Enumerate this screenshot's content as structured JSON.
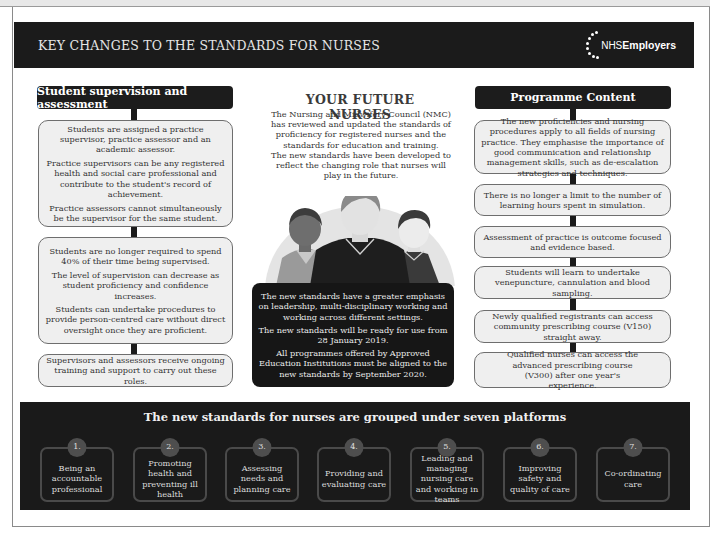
{
  "header": {
    "title": "KEY CHANGES TO THE STANDARDS FOR NURSES",
    "logo_prefix": "NHS",
    "logo_name": "Employers"
  },
  "left": {
    "title": "Student supervision and assessment",
    "boxes": [
      {
        "paragraphs": [
          "Students are assigned a practice supervisor, practice assessor and an academic assessor.",
          "Practice supervisors can be any registered health and social care professional and contribute to the student's record of achievement.",
          "Practice assessors cannot simultaneously be the supervisor for the same student."
        ]
      },
      {
        "paragraphs": [
          "Students are no longer required to spend 40% of their time being supervised.",
          "The level of supervision can decrease as student proficiency and confidence increases.",
          "Students can undertake procedures to provide person-centred care without direct oversight once they are proficient."
        ]
      },
      {
        "paragraphs": [
          "Supervisors and assessors receive ongoing training and support to carry out these roles."
        ]
      }
    ]
  },
  "center": {
    "title": "YOUR FUTURE NURSES",
    "intro": [
      "The Nursing and Midwifery Council (NMC) has reviewed and updated the standards of proficiency for registered nurses and the standards for education and training.",
      "The new standards have been developed to reflect the changing role that nurses will play in the future."
    ],
    "illustration": "three-nurses-illustration",
    "dark_box": [
      "The new standards have a greater emphasis on leadership, multi-disciplinary working and working across different settings.",
      "The new standards will be ready for use from 28 January 2019.",
      "All programmes offered by Approved Education Institutions must be aligned to the new standards by September 2020."
    ]
  },
  "right": {
    "title": "Programme Content",
    "boxes": [
      "The new proficiencies and nursing procedures apply to all fields of nursing practice. They emphasise the importance of good communication and relationship management skills, such as de-escalation strategies and techniques.",
      "There is no longer a limit to the number of learning hours spent in simulation.",
      "Assessment of practice is outcome focused and evidence based.",
      "Students will learn to undertake venepuncture, cannulation and blood sampling.",
      "Newly qualified registrants can access community prescribing course (V150) straight away.",
      "Qualified nurses can access the advanced prescribing course (V300) after one year's experience."
    ]
  },
  "bottom": {
    "title": "The new standards for nurses are grouped under seven platforms",
    "platforms": [
      {
        "num": "1.",
        "label": "Being an accountable professional"
      },
      {
        "num": "2.",
        "label": "Promoting health and preventing ill health"
      },
      {
        "num": "3.",
        "label": "Assessing needs and planning care"
      },
      {
        "num": "4.",
        "label": "Providing and evaluating care"
      },
      {
        "num": "5.",
        "label": "Leading and managing nursing care and working in teams"
      },
      {
        "num": "6.",
        "label": "Improving safety and quality of care"
      },
      {
        "num": "7.",
        "label": "Co-ordinating care"
      }
    ]
  },
  "colors": {
    "dark": "#1a1a1a",
    "box_fill": "#efefef",
    "box_border": "#6e6e6e",
    "platform_border": "#4a4a4a"
  }
}
